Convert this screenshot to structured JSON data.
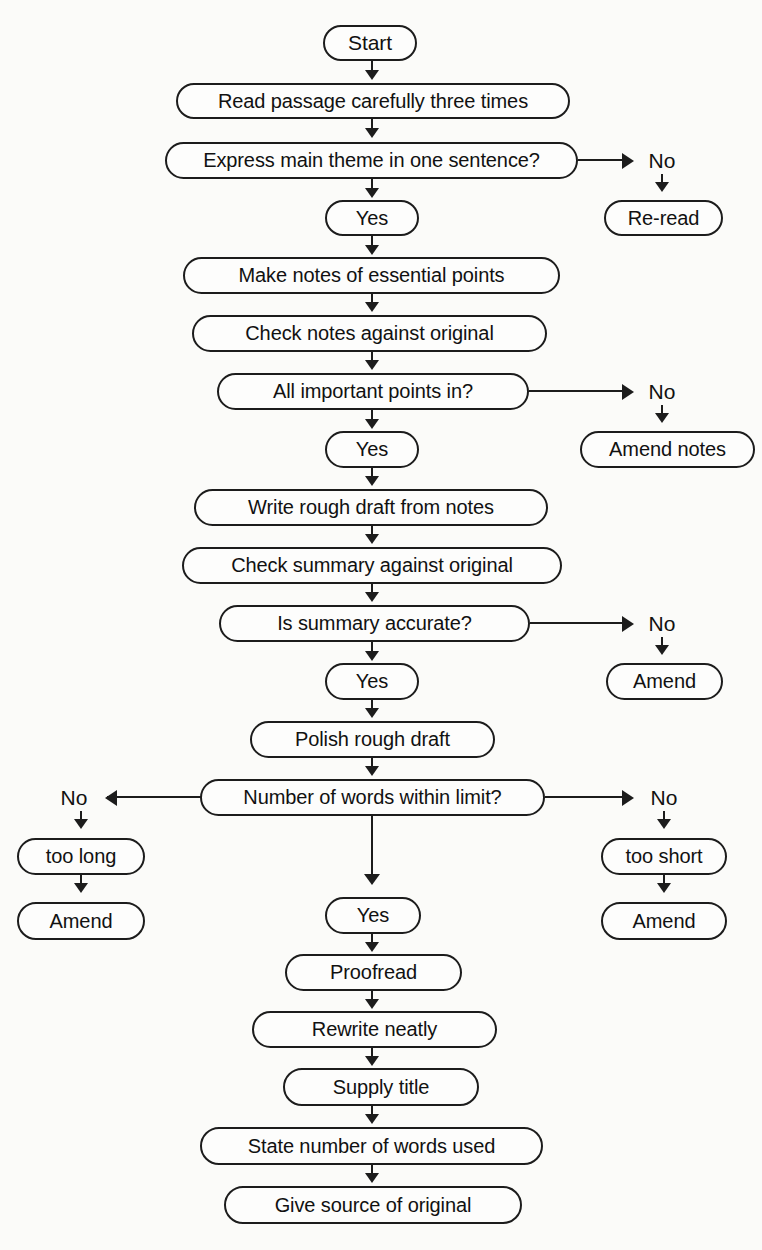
{
  "document": {
    "type": "flowchart",
    "subject": "How to write a summary",
    "clipped_title": "",
    "background_color": "#fbfbf9",
    "stroke_color": "#1c1c1c",
    "text_color": "#111111"
  },
  "nodes": {
    "start": "Start",
    "read_passage": "Read passage carefully three times",
    "express_theme": "Express main theme in one sentence?",
    "yes1": "Yes",
    "no1": "No",
    "re_read": "Re-read",
    "make_notes": "Make notes of essential points",
    "check_notes": "Check notes against original",
    "all_points": "All important points in?",
    "yes2": "Yes",
    "no2": "No",
    "amend_notes": "Amend notes",
    "write_draft": "Write rough draft from notes",
    "check_summary": "Check summary against original",
    "summary_accurate": "Is summary accurate?",
    "yes3": "Yes",
    "no3": "No",
    "amend1": "Amend",
    "polish_draft": "Polish rough draft",
    "word_limit": "Number of words within limit?",
    "no_left": "No",
    "no_right": "No",
    "too_long": "too long",
    "too_short": "too short",
    "amend_left": "Amend",
    "amend_right": "Amend",
    "yes4": "Yes",
    "proofread": "Proofread",
    "rewrite": "Rewrite neatly",
    "supply_title": "Supply title",
    "state_words": "State number of words used",
    "give_source": "Give source of original"
  },
  "flow_data": {
    "type": "flowchart",
    "orientation": "top-to-bottom",
    "steps": [
      {
        "id": "start",
        "label": "Start",
        "shape": "stadium"
      },
      {
        "id": "read_passage",
        "label": "Read passage carefully three times",
        "shape": "stadium"
      },
      {
        "id": "express_theme",
        "label": "Express main theme in one sentence?",
        "shape": "stadium",
        "decision": true
      },
      {
        "id": "yes1",
        "label": "Yes",
        "shape": "stadium"
      },
      {
        "id": "no1",
        "label": "No",
        "shape": "text"
      },
      {
        "id": "re_read",
        "label": "Re-read",
        "shape": "stadium"
      },
      {
        "id": "make_notes",
        "label": "Make notes of essential points",
        "shape": "stadium"
      },
      {
        "id": "check_notes",
        "label": "Check notes against original",
        "shape": "stadium"
      },
      {
        "id": "all_points",
        "label": "All important points in?",
        "shape": "stadium",
        "decision": true
      },
      {
        "id": "yes2",
        "label": "Yes",
        "shape": "stadium"
      },
      {
        "id": "no2",
        "label": "No",
        "shape": "text"
      },
      {
        "id": "amend_notes",
        "label": "Amend notes",
        "shape": "stadium"
      },
      {
        "id": "write_draft",
        "label": "Write rough draft from notes",
        "shape": "stadium"
      },
      {
        "id": "check_summary",
        "label": "Check summary against original",
        "shape": "stadium"
      },
      {
        "id": "summary_accurate",
        "label": "Is summary accurate?",
        "shape": "stadium",
        "decision": true
      },
      {
        "id": "yes3",
        "label": "Yes",
        "shape": "stadium"
      },
      {
        "id": "no3",
        "label": "No",
        "shape": "text"
      },
      {
        "id": "amend1",
        "label": "Amend",
        "shape": "stadium"
      },
      {
        "id": "polish_draft",
        "label": "Polish rough draft",
        "shape": "stadium"
      },
      {
        "id": "word_limit",
        "label": "Number of words within limit?",
        "shape": "stadium",
        "decision": true
      },
      {
        "id": "no_left",
        "label": "No",
        "shape": "text"
      },
      {
        "id": "too_long",
        "label": "too long",
        "shape": "stadium"
      },
      {
        "id": "amend_left",
        "label": "Amend",
        "shape": "stadium"
      },
      {
        "id": "no_right",
        "label": "No",
        "shape": "text"
      },
      {
        "id": "too_short",
        "label": "too short",
        "shape": "stadium"
      },
      {
        "id": "amend_right",
        "label": "Amend",
        "shape": "stadium"
      },
      {
        "id": "yes4",
        "label": "Yes",
        "shape": "stadium"
      },
      {
        "id": "proofread",
        "label": "Proofread",
        "shape": "stadium"
      },
      {
        "id": "rewrite",
        "label": "Rewrite neatly",
        "shape": "stadium"
      },
      {
        "id": "supply_title",
        "label": "Supply title",
        "shape": "stadium"
      },
      {
        "id": "state_words",
        "label": "State number of words used",
        "shape": "stadium"
      },
      {
        "id": "give_source",
        "label": "Give source of original",
        "shape": "stadium"
      }
    ],
    "edges": [
      {
        "from": "start",
        "to": "read_passage",
        "direction": "down"
      },
      {
        "from": "read_passage",
        "to": "express_theme",
        "direction": "down"
      },
      {
        "from": "express_theme",
        "to": "yes1",
        "direction": "down",
        "label": "Yes"
      },
      {
        "from": "express_theme",
        "to": "no1",
        "direction": "right",
        "label": "No"
      },
      {
        "from": "no1",
        "to": "re_read",
        "direction": "down"
      },
      {
        "from": "yes1",
        "to": "make_notes",
        "direction": "down"
      },
      {
        "from": "make_notes",
        "to": "check_notes",
        "direction": "down"
      },
      {
        "from": "check_notes",
        "to": "all_points",
        "direction": "down"
      },
      {
        "from": "all_points",
        "to": "yes2",
        "direction": "down",
        "label": "Yes"
      },
      {
        "from": "all_points",
        "to": "no2",
        "direction": "right",
        "label": "No"
      },
      {
        "from": "no2",
        "to": "amend_notes",
        "direction": "down"
      },
      {
        "from": "yes2",
        "to": "write_draft",
        "direction": "down"
      },
      {
        "from": "write_draft",
        "to": "check_summary",
        "direction": "down"
      },
      {
        "from": "check_summary",
        "to": "summary_accurate",
        "direction": "down"
      },
      {
        "from": "summary_accurate",
        "to": "yes3",
        "direction": "down",
        "label": "Yes"
      },
      {
        "from": "summary_accurate",
        "to": "no3",
        "direction": "right",
        "label": "No"
      },
      {
        "from": "no3",
        "to": "amend1",
        "direction": "down"
      },
      {
        "from": "yes3",
        "to": "polish_draft",
        "direction": "down"
      },
      {
        "from": "polish_draft",
        "to": "word_limit",
        "direction": "down"
      },
      {
        "from": "word_limit",
        "to": "no_left",
        "direction": "left",
        "label": "No"
      },
      {
        "from": "no_left",
        "to": "too_long",
        "direction": "down"
      },
      {
        "from": "too_long",
        "to": "amend_left",
        "direction": "down"
      },
      {
        "from": "word_limit",
        "to": "no_right",
        "direction": "right",
        "label": "No"
      },
      {
        "from": "no_right",
        "to": "too_short",
        "direction": "down"
      },
      {
        "from": "too_short",
        "to": "amend_right",
        "direction": "down"
      },
      {
        "from": "word_limit",
        "to": "yes4",
        "direction": "down",
        "label": "Yes"
      },
      {
        "from": "yes4",
        "to": "proofread",
        "direction": "down"
      },
      {
        "from": "proofread",
        "to": "rewrite",
        "direction": "down"
      },
      {
        "from": "rewrite",
        "to": "supply_title",
        "direction": "down"
      },
      {
        "from": "supply_title",
        "to": "state_words",
        "direction": "down"
      },
      {
        "from": "state_words",
        "to": "give_source",
        "direction": "down"
      }
    ]
  }
}
